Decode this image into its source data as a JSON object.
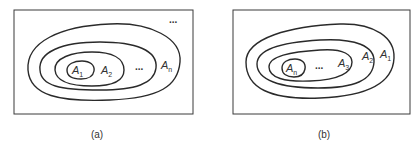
{
  "figure": {
    "panel_a": {
      "caption": "(a)",
      "labels": {
        "inner": "A",
        "inner_sub": "1",
        "second": "A",
        "second_sub": "2",
        "outer": "A",
        "outer_sub": "n",
        "ellipsis_middle": "...",
        "ellipsis_corner": "..."
      }
    },
    "panel_b": {
      "caption": "(b)",
      "labels": {
        "inner": "A",
        "inner_sub": "n",
        "third": "A",
        "third_sub": "3",
        "second": "A",
        "second_sub": "2",
        "outer": "A",
        "outer_sub": "1",
        "ellipsis_middle": "..."
      }
    }
  },
  "colors": {
    "line": "#2a2a2a",
    "text": "#333333",
    "background": "#ffffff"
  }
}
